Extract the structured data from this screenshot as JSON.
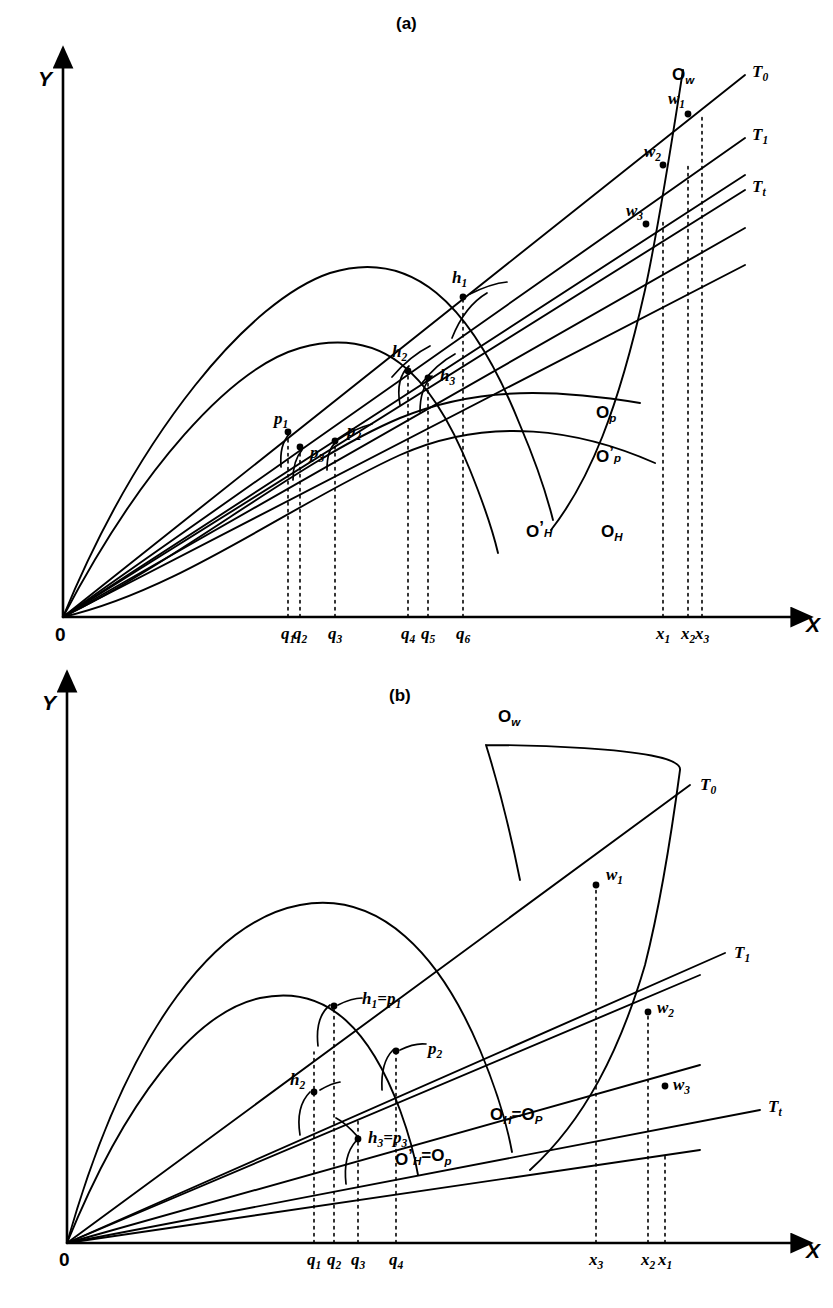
{
  "figure": {
    "kind": "two-panel line diagram",
    "background": "#ffffff",
    "stroke_color": "#000000"
  },
  "panels": [
    {
      "id": "a",
      "title": "(a)",
      "title_xy": [
        407,
        27
      ],
      "axes": {
        "x_label": "X",
        "y_label": "Y",
        "origin_label": "0",
        "origin_px": [
          63,
          617
        ],
        "x_end_px": 793,
        "y_top_px": 66,
        "x_label_xy": [
          806,
          632
        ],
        "y_label_xy": [
          38,
          86
        ],
        "origin_label_xy": [
          55,
          641
        ]
      },
      "x_ticks": [
        {
          "name": "q1",
          "label": "q",
          "sub": "1",
          "x": 288,
          "top": 432
        },
        {
          "name": "q2",
          "label": "q",
          "sub": "2",
          "x": 300,
          "top": 447
        },
        {
          "name": "q3",
          "label": "q",
          "sub": "3",
          "x": 335,
          "top": 441
        },
        {
          "name": "q4",
          "label": "q",
          "sub": "4",
          "x": 408,
          "top": 371
        },
        {
          "name": "q5",
          "label": "q",
          "sub": "5",
          "x": 428,
          "top": 378
        },
        {
          "name": "q6",
          "label": "q",
          "sub": "6",
          "x": 463,
          "top": 297
        },
        {
          "name": "x1",
          "label": "x",
          "sub": "1",
          "x": 663,
          "top": 222
        },
        {
          "name": "x2",
          "label": "x",
          "sub": "2",
          "x": 688,
          "top": 163
        },
        {
          "name": "x3",
          "label": "x",
          "sub": "3",
          "x": 702,
          "top": 113
        }
      ],
      "tangent_lines": [
        {
          "name": "T0",
          "label": "T",
          "sub": "0",
          "from": [
            63,
            617
          ],
          "to": [
            745,
            75
          ],
          "label_xy": [
            752,
            77
          ]
        },
        {
          "name": "T1",
          "label": "T",
          "sub": "1",
          "from": [
            63,
            617
          ],
          "to": [
            745,
            138
          ],
          "label_xy": [
            752,
            140
          ]
        },
        {
          "name": "Tt",
          "label": "T",
          "sub": "t",
          "from": [
            63,
            617
          ],
          "to": [
            745,
            190
          ],
          "label_xy": [
            752,
            192
          ]
        }
      ],
      "curves": [
        {
          "name": "O_H",
          "label": "O",
          "sub": "H",
          "prime": false,
          "label_xy": [
            601,
            537
          ],
          "path": "M63,617 C140,430 250,300 330,273 C410,248 470,300 520,425 C540,472 548,500 553,520"
        },
        {
          "name": "O_Hprime",
          "label": "O",
          "sub": "H",
          "prime": true,
          "label_xy": [
            526,
            537
          ],
          "path": "M63,617 C140,470 230,368 300,348 C380,326 430,370 470,470 C487,512 494,536 498,553"
        },
        {
          "name": "O_p",
          "label": "O",
          "sub": "p",
          "prime": false,
          "label_xy": [
            596,
            418
          ],
          "path": "M63,617 C180,560 300,460 400,418 C480,385 560,390 640,403"
        },
        {
          "name": "O_pprime",
          "label": "O",
          "sub": "p",
          "prime": true,
          "label_xy": [
            596,
            462
          ],
          "path": "M63,617 C180,590 290,505 400,455 C490,415 580,430 655,463"
        },
        {
          "name": "O_w",
          "label": "O",
          "sub": "w",
          "prime": false,
          "label_xy": [
            672,
            80
          ],
          "path": "M683,70 C672,140 660,220 645,290 C618,410 590,480 551,530"
        }
      ],
      "rays": [
        {
          "name": "ray-p1",
          "from": [
            63,
            617
          ],
          "to": [
            745,
            175
          ]
        },
        {
          "name": "ray-p2",
          "from": [
            63,
            617
          ],
          "to": [
            745,
            228
          ]
        },
        {
          "name": "ray-p3",
          "from": [
            63,
            617
          ],
          "to": [
            745,
            265
          ]
        }
      ],
      "points": [
        {
          "name": "h1",
          "label": "h",
          "sub": "1",
          "xy": [
            463,
            297
          ],
          "label_xy": [
            452,
            283
          ],
          "dot": true
        },
        {
          "name": "h2",
          "label": "h",
          "sub": "2",
          "xy": [
            408,
            371
          ],
          "label_xy": [
            392,
            357
          ],
          "dot": true
        },
        {
          "name": "h3",
          "label": "h",
          "sub": "3",
          "xy": [
            428,
            378
          ],
          "label_xy": [
            440,
            381
          ],
          "dot": true
        },
        {
          "name": "p1",
          "label": "p",
          "sub": "1",
          "xy": [
            288,
            432
          ],
          "label_xy": [
            274,
            424
          ],
          "dot": true
        },
        {
          "name": "p2",
          "label": "p",
          "sub": "2",
          "xy": [
            335,
            441
          ],
          "label_xy": [
            347,
            436
          ],
          "dot": true
        },
        {
          "name": "p3",
          "label": "p",
          "sub": "3",
          "xy": [
            300,
            447
          ],
          "label_xy": [
            310,
            458
          ],
          "dot": true
        },
        {
          "name": "w1",
          "label": "w",
          "sub": "1",
          "xy": [
            688,
            114
          ],
          "label_xy": [
            668,
            104
          ],
          "dot": true
        },
        {
          "name": "w2",
          "label": "w",
          "sub": "2",
          "xy": [
            663,
            165
          ],
          "label_xy": [
            644,
            157
          ],
          "dot": true
        },
        {
          "name": "w3",
          "label": "w",
          "sub": "3",
          "xy": [
            646,
            224
          ],
          "label_xy": [
            626,
            216
          ],
          "dot": true
        }
      ],
      "tangent_arcs": [
        {
          "name": "arc-h1",
          "d": "M452,338 C460,318 470,303 487,293"
        },
        {
          "name": "arc-h2",
          "d": "M400,405 C397,388 399,375 409,366"
        },
        {
          "name": "arc-h3",
          "d": "M420,412 C420,396 423,385 432,376"
        },
        {
          "name": "arc-p1",
          "d": "M281,467 C280,452 282,442 290,433"
        },
        {
          "name": "arc-p2",
          "d": "M327,470 C327,457 329,448 337,441"
        },
        {
          "name": "arc-p3",
          "d": "M293,480 C293,467 295,458 302,450"
        }
      ],
      "pointers": [
        {
          "name": "ptr-h1",
          "d": "M470,294 C484,287 497,283 507,282"
        },
        {
          "name": "ptr-h2",
          "d": "M392,377 C404,363 418,352 430,346"
        },
        {
          "name": "ptr-h3",
          "d": "M422,383 C432,370 444,360 455,354"
        },
        {
          "name": "ptr-p2",
          "d": "M336,441 C348,433 360,427 372,424"
        }
      ]
    },
    {
      "id": "b",
      "title": "(b)",
      "title_xy": [
        400,
        698
      ],
      "axes": {
        "x_label": "X",
        "y_label": "Y",
        "origin_label": "0",
        "origin_px": [
          67,
          1243
        ],
        "x_end_px": 793,
        "y_top_px": 690,
        "x_label_xy": [
          806,
          1258
        ],
        "y_label_xy": [
          42,
          710
        ],
        "origin_label_xy": [
          59,
          1266
        ]
      },
      "x_ticks": [
        {
          "name": "q1",
          "label": "q",
          "sub": "1",
          "x": 314,
          "top": 1052
        },
        {
          "name": "q2",
          "label": "q",
          "sub": "2",
          "x": 334,
          "top": 1006
        },
        {
          "name": "q3",
          "label": "q",
          "sub": "3",
          "x": 358,
          "top": 1119
        },
        {
          "name": "q4",
          "label": "q",
          "sub": "4",
          "x": 396,
          "top": 1051
        },
        {
          "name": "x3",
          "label": "x",
          "sub": "3",
          "x": 596,
          "top": 885
        },
        {
          "name": "x2",
          "label": "x",
          "sub": "2",
          "x": 648,
          "top": 1012
        },
        {
          "name": "x1",
          "label": "x",
          "sub": "1",
          "x": 665,
          "top": 1155
        }
      ],
      "tangent_lines": [
        {
          "name": "T0",
          "label": "T",
          "sub": "0",
          "from": [
            67,
            1243
          ],
          "to": [
            690,
            785
          ],
          "label_xy": [
            700,
            790
          ]
        },
        {
          "name": "T1",
          "label": "T",
          "sub": "1",
          "from": [
            67,
            1243
          ],
          "to": [
            725,
            953
          ],
          "label_xy": [
            734,
            958
          ]
        },
        {
          "name": "Tt",
          "label": "T",
          "sub": "t",
          "from": [
            67,
            1243
          ],
          "to": [
            760,
            1110
          ],
          "label_xy": [
            768,
            1112
          ]
        }
      ],
      "curves": [
        {
          "name": "O_H_eq_O_P",
          "label": "O",
          "sub": "H",
          "eq": "=O",
          "sub2": "P",
          "prime": false,
          "label_xy": [
            490,
            1120
          ],
          "path": "M67,1243 C130,1020 220,920 300,905 C380,890 440,955 480,1050 C500,1098 508,1130 512,1152"
        },
        {
          "name": "O_Hprime_eq_O_pprime",
          "label": "O",
          "sub": "H",
          "eq": "=O",
          "sub2": "p",
          "prime": true,
          "label_xy": [
            395,
            1165
          ],
          "path": "M67,1243 C125,1100 195,1012 260,998 C330,983 372,1035 400,1110 C412,1143 416,1163 418,1175"
        },
        {
          "name": "O_w",
          "label": "O",
          "sub": "w",
          "prime": false,
          "label_xy": [
            498,
            722
          ],
          "path": "M530,1170 C585,1120 620,1050 645,965 C662,898 672,830 680,770 C684,745 486,745 486,745 M486,745 C500,790 510,830 520,880"
        }
      ],
      "rays": [
        {
          "name": "ray-b1",
          "from": [
            67,
            1243
          ],
          "to": [
            700,
            975
          ]
        },
        {
          "name": "ray-b2",
          "from": [
            67,
            1243
          ],
          "to": [
            700,
            1065
          ]
        },
        {
          "name": "ray-b3",
          "from": [
            67,
            1243
          ],
          "to": [
            700,
            1150
          ]
        }
      ],
      "points": [
        {
          "name": "h1_eq_p1",
          "label": "h",
          "sub": "1",
          "eq": "=p",
          "sub2": "1",
          "xy": [
            334,
            1006
          ],
          "label_xy": [
            362,
            1004
          ],
          "dot": true
        },
        {
          "name": "p2",
          "label": "p",
          "sub": "2",
          "xy": [
            396,
            1051
          ],
          "label_xy": [
            428,
            1054
          ],
          "dot": true
        },
        {
          "name": "h2",
          "label": "h",
          "sub": "2",
          "xy": [
            314,
            1092
          ],
          "label_xy": [
            290,
            1085
          ],
          "dot": true
        },
        {
          "name": "h3_eq_p3",
          "label": "h",
          "sub": "3",
          "eq": "=p",
          "sub2": "3",
          "xy": [
            358,
            1139
          ],
          "label_xy": [
            368,
            1143
          ],
          "dot": true
        },
        {
          "name": "w1",
          "label": "w",
          "sub": "1",
          "xy": [
            596,
            885
          ],
          "label_xy": [
            606,
            880
          ],
          "dot": true
        },
        {
          "name": "w2",
          "label": "w",
          "sub": "2",
          "xy": [
            648,
            1012
          ],
          "label_xy": [
            657,
            1013
          ],
          "dot": true
        },
        {
          "name": "w3",
          "label": "w",
          "sub": "3",
          "xy": [
            665,
            1086
          ],
          "label_xy": [
            673,
            1090
          ],
          "dot": true
        }
      ],
      "tangent_arcs": [
        {
          "name": "arc-h1b",
          "d": "M318,1046 C316,1028 320,1013 330,1005"
        },
        {
          "name": "arc-h2b",
          "d": "M300,1135 C297,1116 300,1102 310,1092"
        },
        {
          "name": "arc-h3b",
          "d": "M346,1184 C344,1166 347,1151 356,1141"
        },
        {
          "name": "arc-p2b",
          "d": "M382,1090 C381,1072 384,1059 393,1050"
        }
      ],
      "pointers": [
        {
          "name": "ptr-h1b",
          "d": "M338,1005 C348,1000 356,998 362,998"
        },
        {
          "name": "ptr-p2b",
          "d": "M400,1050 C410,1045 418,1043 426,1044"
        },
        {
          "name": "ptr-h2b",
          "d": "M320,1090 C327,1086 333,1083 340,1082"
        },
        {
          "name": "ptr-h3b",
          "d": "M358,1137 C350,1128 344,1122 336,1118"
        }
      ]
    }
  ]
}
